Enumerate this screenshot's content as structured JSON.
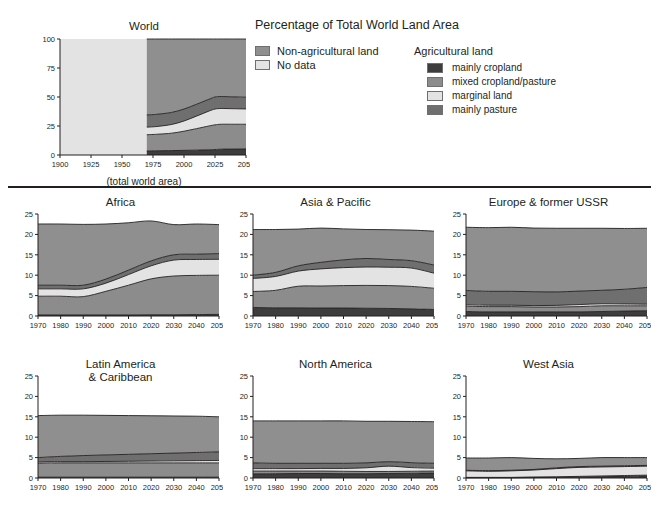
{
  "legend": {
    "title": "Percentage of Total World Land Area",
    "primary": [
      {
        "label": "Non-agricultural land",
        "color": "#8f8f8f",
        "name": "non-agricultural-land"
      },
      {
        "label": "No data",
        "color": "#e3e3e3",
        "name": "no-data"
      }
    ],
    "group_title": "Agricultural land",
    "agricultural": [
      {
        "label": "mainly cropland",
        "color": "#3d3d3d",
        "name": "mainly-cropland"
      },
      {
        "label": "mixed cropland/pasture",
        "color": "#8c8c8c",
        "name": "mixed-cropland-pasture"
      },
      {
        "label": "marginal land",
        "color": "#e3e3e3",
        "name": "marginal-land"
      },
      {
        "label": "mainly pasture",
        "color": "#6f6f6f",
        "name": "mainly-pasture"
      }
    ]
  },
  "world_caption": "(total world area)",
  "chart_data": [
    {
      "type": "area",
      "name": "world",
      "title": "World",
      "stacked": true,
      "grid": false,
      "legend_position": "external-top-right",
      "xlabel": "",
      "ylabel": "",
      "xlim": [
        1900,
        2050
      ],
      "ylim": [
        0,
        100
      ],
      "xticks": [
        1900,
        1925,
        1950,
        1975,
        2000,
        2025,
        2050
      ],
      "yticks": [
        0,
        25,
        50,
        75,
        100
      ],
      "x": [
        1900,
        1970,
        1975,
        1980,
        1990,
        2000,
        2010,
        2020,
        2025,
        2030,
        2040,
        2050
      ],
      "nodata_until": 1970,
      "series": [
        {
          "name": "mainly cropland",
          "color": "#3d3d3d",
          "values": [
            0,
            3.5,
            3.6,
            3.7,
            3.8,
            4.0,
            4.2,
            4.5,
            4.7,
            5.0,
            5.1,
            5.2
          ]
        },
        {
          "name": "mixed cropland/pasture",
          "color": "#8c8c8c",
          "values": [
            0,
            14.0,
            14.1,
            14.3,
            15.0,
            16.5,
            18.5,
            20.5,
            21.3,
            21.5,
            21.4,
            21.3
          ]
        },
        {
          "name": "marginal land",
          "color": "#e3e3e3",
          "values": [
            0,
            6.5,
            6.6,
            6.8,
            7.5,
            8.8,
            10.8,
            12.8,
            13.6,
            13.6,
            13.4,
            13.2
          ]
        },
        {
          "name": "mainly pasture",
          "color": "#6f6f6f",
          "values": [
            0,
            10.5,
            10.5,
            10.5,
            10.4,
            10.3,
            10.2,
            10.2,
            10.4,
            10.3,
            10.2,
            10.1
          ]
        },
        {
          "name": "non-agricultural land",
          "color": "#8f8f8f",
          "values": [
            0,
            65.5,
            65.2,
            64.7,
            63.3,
            60.4,
            56.3,
            52.0,
            50.0,
            49.6,
            49.9,
            50.2
          ]
        }
      ]
    },
    {
      "type": "area",
      "name": "africa",
      "title": "Africa",
      "stacked": true,
      "grid": false,
      "xlim": [
        1970,
        2050
      ],
      "ylim": [
        0,
        25
      ],
      "xticks": [
        1970,
        1980,
        1990,
        2000,
        2010,
        2020,
        2030,
        2040,
        2050
      ],
      "yticks": [
        0,
        5,
        10,
        15,
        20,
        25
      ],
      "x": [
        1970,
        1980,
        1990,
        2000,
        2010,
        2020,
        2030,
        2040,
        2050
      ],
      "series": [
        {
          "name": "mainly cropland",
          "color": "#3d3d3d",
          "values": [
            0.25,
            0.25,
            0.25,
            0.25,
            0.25,
            0.3,
            0.3,
            0.35,
            0.4
          ]
        },
        {
          "name": "mixed cropland/pasture",
          "color": "#8c8c8c",
          "values": [
            4.6,
            4.6,
            4.5,
            5.8,
            7.3,
            8.8,
            9.5,
            9.6,
            9.6
          ]
        },
        {
          "name": "marginal land",
          "color": "#e3e3e3",
          "values": [
            1.8,
            1.8,
            1.9,
            2.0,
            2.6,
            3.2,
            3.9,
            3.9,
            3.9
          ]
        },
        {
          "name": "mainly pasture",
          "color": "#6f6f6f",
          "values": [
            0.9,
            0.9,
            0.9,
            1.0,
            1.1,
            1.2,
            1.3,
            1.3,
            1.4
          ]
        },
        {
          "name": "non-agricultural land",
          "color": "#8f8f8f",
          "values": [
            15.0,
            15.0,
            14.9,
            13.5,
            11.6,
            9.8,
            7.4,
            7.4,
            7.1
          ]
        }
      ]
    },
    {
      "type": "area",
      "name": "asia-pacific",
      "title": "Asia & Pacific",
      "stacked": true,
      "grid": false,
      "xlim": [
        1970,
        2050
      ],
      "ylim": [
        0,
        25
      ],
      "xticks": [
        1970,
        1980,
        1990,
        2000,
        2010,
        2020,
        2030,
        2040,
        2050
      ],
      "yticks": [
        0,
        5,
        10,
        15,
        20,
        25
      ],
      "x": [
        1970,
        1980,
        1990,
        2000,
        2010,
        2020,
        2030,
        2040,
        2050
      ],
      "series": [
        {
          "name": "mainly cropland",
          "color": "#3d3d3d",
          "values": [
            2.1,
            2.0,
            2.0,
            1.95,
            1.95,
            1.9,
            1.85,
            1.75,
            1.6
          ]
        },
        {
          "name": "mixed cropland/pasture",
          "color": "#8c8c8c",
          "values": [
            3.9,
            4.3,
            5.3,
            5.4,
            5.5,
            5.6,
            5.6,
            5.5,
            5.2
          ]
        },
        {
          "name": "marginal land",
          "color": "#e3e3e3",
          "values": [
            3.2,
            3.4,
            3.7,
            4.2,
            4.4,
            4.5,
            4.5,
            4.5,
            3.7
          ]
        },
        {
          "name": "mainly pasture",
          "color": "#6f6f6f",
          "values": [
            0.8,
            1.0,
            1.3,
            1.6,
            1.9,
            2.1,
            1.9,
            1.8,
            2.0
          ]
        },
        {
          "name": "non-agricultural land",
          "color": "#8f8f8f",
          "values": [
            11.2,
            10.5,
            9.0,
            8.4,
            7.6,
            7.1,
            7.3,
            7.5,
            8.3
          ]
        }
      ]
    },
    {
      "type": "area",
      "name": "europe-former-ussr",
      "title": "Europe & former USSR",
      "stacked": true,
      "grid": false,
      "xlim": [
        1970,
        2050
      ],
      "ylim": [
        0,
        25
      ],
      "xticks": [
        1970,
        1980,
        1990,
        2000,
        2010,
        2020,
        2030,
        2040,
        2050
      ],
      "yticks": [
        0,
        5,
        10,
        15,
        20,
        25
      ],
      "x": [
        1970,
        1980,
        1990,
        2000,
        2010,
        2020,
        2030,
        2040,
        2050
      ],
      "series": [
        {
          "name": "mainly cropland",
          "color": "#3d3d3d",
          "values": [
            1.1,
            1.0,
            1.0,
            1.0,
            1.0,
            1.0,
            1.1,
            1.2,
            1.3
          ]
        },
        {
          "name": "mixed cropland/pasture",
          "color": "#8c8c8c",
          "values": [
            1.3,
            1.3,
            1.3,
            1.2,
            1.2,
            1.3,
            1.4,
            1.3,
            1.2
          ]
        },
        {
          "name": "marginal land",
          "color": "#e3e3e3",
          "values": [
            0.35,
            0.35,
            0.35,
            0.35,
            0.4,
            0.5,
            0.5,
            0.45,
            0.4
          ]
        },
        {
          "name": "mainly pasture",
          "color": "#6f6f6f",
          "values": [
            3.5,
            3.4,
            3.4,
            3.4,
            3.3,
            3.3,
            3.3,
            3.6,
            4.1
          ]
        },
        {
          "name": "non-agricultural land",
          "color": "#8f8f8f",
          "values": [
            15.5,
            15.6,
            15.7,
            15.6,
            15.6,
            15.4,
            15.2,
            14.9,
            14.5
          ]
        }
      ]
    },
    {
      "type": "area",
      "name": "latin-america-caribbean",
      "title": "Latin America\n& Caribbean",
      "stacked": true,
      "grid": false,
      "xlim": [
        1970,
        2050
      ],
      "ylim": [
        0,
        25
      ],
      "xticks": [
        1970,
        1980,
        1990,
        2000,
        2010,
        2020,
        2030,
        2040,
        2050
      ],
      "yticks": [
        0,
        5,
        10,
        15,
        20,
        25
      ],
      "x": [
        1970,
        1980,
        1990,
        2000,
        2010,
        2020,
        2030,
        2040,
        2050
      ],
      "series": [
        {
          "name": "mainly cropland",
          "color": "#3d3d3d",
          "values": [
            0.2,
            0.2,
            0.2,
            0.2,
            0.2,
            0.2,
            0.2,
            0.2,
            0.2
          ]
        },
        {
          "name": "mixed cropland/pasture",
          "color": "#8c8c8c",
          "values": [
            3.4,
            3.5,
            3.5,
            3.5,
            3.5,
            3.5,
            3.5,
            3.5,
            3.5
          ]
        },
        {
          "name": "marginal land",
          "color": "#e3e3e3",
          "values": [
            0.3,
            0.3,
            0.3,
            0.35,
            0.4,
            0.45,
            0.5,
            0.55,
            0.6
          ]
        },
        {
          "name": "mainly pasture",
          "color": "#6f6f6f",
          "values": [
            1.1,
            1.3,
            1.5,
            1.6,
            1.7,
            1.8,
            1.9,
            2.0,
            2.1
          ]
        },
        {
          "name": "non-agricultural land",
          "color": "#8f8f8f",
          "values": [
            10.3,
            10.1,
            9.9,
            9.7,
            9.5,
            9.3,
            9.1,
            8.9,
            8.6
          ]
        }
      ]
    },
    {
      "type": "area",
      "name": "north-america",
      "title": "North America",
      "stacked": true,
      "grid": false,
      "xlim": [
        1970,
        2050
      ],
      "ylim": [
        0,
        25
      ],
      "xticks": [
        1970,
        1980,
        1990,
        2000,
        2010,
        2020,
        2030,
        2040,
        2050
      ],
      "yticks": [
        0,
        5,
        10,
        15,
        20,
        25
      ],
      "x": [
        1970,
        1980,
        1990,
        2000,
        2010,
        2020,
        2030,
        2040,
        2050
      ],
      "series": [
        {
          "name": "mainly cropland",
          "color": "#3d3d3d",
          "values": [
            1.0,
            1.05,
            1.1,
            1.1,
            1.05,
            1.05,
            1.1,
            1.15,
            1.2
          ]
        },
        {
          "name": "mixed cropland/pasture",
          "color": "#8c8c8c",
          "values": [
            0.7,
            0.65,
            0.6,
            0.6,
            0.6,
            0.55,
            0.5,
            0.5,
            0.5
          ]
        },
        {
          "name": "marginal land",
          "color": "#e3e3e3",
          "values": [
            0.6,
            0.6,
            0.6,
            0.65,
            0.7,
            0.9,
            1.3,
            0.9,
            0.7
          ]
        },
        {
          "name": "mainly pasture",
          "color": "#6f6f6f",
          "values": [
            1.4,
            1.3,
            1.3,
            1.25,
            1.25,
            1.2,
            1.1,
            1.2,
            1.2
          ]
        },
        {
          "name": "non-agricultural land",
          "color": "#8f8f8f",
          "values": [
            10.3,
            10.4,
            10.4,
            10.4,
            10.4,
            10.2,
            9.9,
            10.1,
            10.2
          ]
        }
      ]
    },
    {
      "type": "area",
      "name": "west-asia",
      "title": "West Asia",
      "stacked": true,
      "grid": false,
      "xlim": [
        1970,
        2050
      ],
      "ylim": [
        0,
        25
      ],
      "xticks": [
        1970,
        1980,
        1990,
        2000,
        2010,
        2020,
        2030,
        2040,
        2050
      ],
      "yticks": [
        0,
        5,
        10,
        15,
        20,
        25
      ],
      "x": [
        1970,
        1980,
        1990,
        2000,
        2010,
        2020,
        2030,
        2040,
        2050
      ],
      "series": [
        {
          "name": "mainly cropland",
          "color": "#3d3d3d",
          "values": [
            0.05,
            0.05,
            0.05,
            0.1,
            0.15,
            0.2,
            0.3,
            0.4,
            0.5
          ]
        },
        {
          "name": "mixed cropland/pasture",
          "color": "#8c8c8c",
          "values": [
            0.1,
            0.1,
            0.1,
            0.15,
            0.15,
            0.2,
            0.2,
            0.2,
            0.2
          ]
        },
        {
          "name": "marginal land",
          "color": "#e3e3e3",
          "values": [
            1.6,
            1.5,
            1.6,
            1.7,
            2.0,
            2.2,
            2.2,
            2.2,
            2.2
          ]
        },
        {
          "name": "mainly pasture",
          "color": "#6f6f6f",
          "values": [
            0.15,
            0.15,
            0.15,
            0.15,
            0.2,
            0.2,
            0.2,
            0.2,
            0.2
          ]
        },
        {
          "name": "non-agricultural land",
          "color": "#8f8f8f",
          "values": [
            3.0,
            3.1,
            3.1,
            2.7,
            2.2,
            2.0,
            2.1,
            2.0,
            1.9
          ]
        }
      ]
    }
  ]
}
